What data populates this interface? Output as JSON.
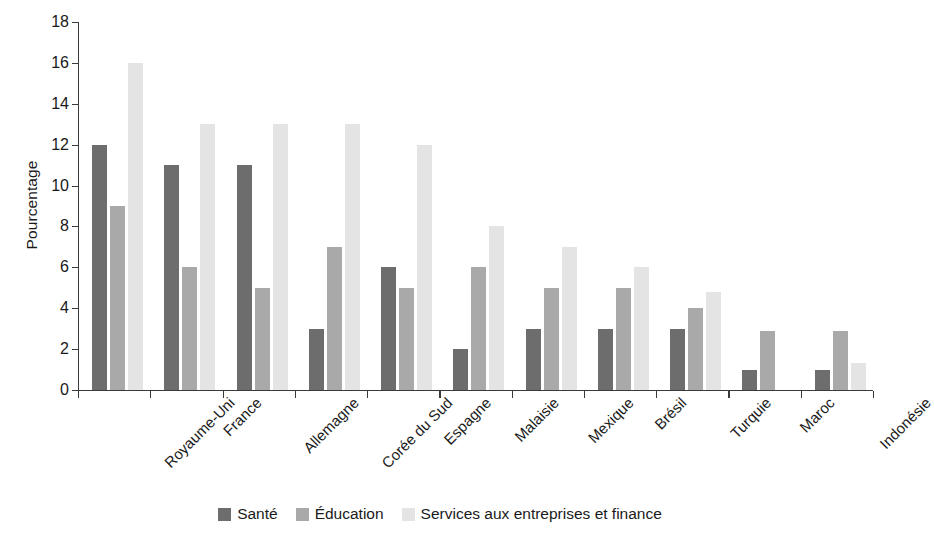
{
  "chart_data": {
    "type": "bar",
    "title": "",
    "xlabel": "",
    "ylabel": "Pourcentage",
    "ylim": [
      0,
      18
    ],
    "yticks": [
      0,
      2,
      4,
      6,
      8,
      10,
      12,
      14,
      16,
      18
    ],
    "grid": false,
    "legend_position": "bottom-center",
    "categories": [
      "Royaume-Uni",
      "France",
      "Allemagne",
      "Corée du Sud",
      "Espagne",
      "Malaisie",
      "Mexique",
      "Brésil",
      "Turquie",
      "Maroc",
      "Indonésie"
    ],
    "series": [
      {
        "name": "Santé",
        "color": "#6d6d6d",
        "values": [
          12,
          11,
          11,
          3,
          6,
          2,
          3,
          3,
          3,
          1,
          1
        ]
      },
      {
        "name": "Éducation",
        "color": "#a9a9a9",
        "values": [
          9,
          6,
          5,
          7,
          5,
          6,
          5,
          5,
          4,
          2.9,
          2.9
        ]
      },
      {
        "name": "Services aux entreprises et finance",
        "color": "#e4e4e4",
        "values": [
          16,
          13,
          13,
          13,
          12,
          8,
          7,
          6,
          4.8,
          0,
          1.3
        ]
      }
    ]
  },
  "axis": {
    "y_label": "Pourcentage"
  },
  "colors": {
    "sante": "#6d6d6d",
    "education": "#a9a9a9",
    "services": "#e4e4e4",
    "axis": "#3a3a3a",
    "text": "#1a1a1a",
    "background": "#ffffff"
  }
}
